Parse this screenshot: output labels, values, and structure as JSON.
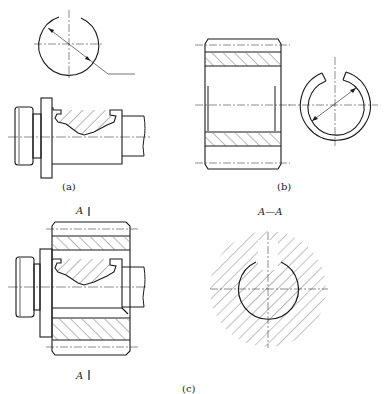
{
  "figure": {
    "captions": {
      "a": "(a)",
      "b": "(b)",
      "c": "(c)"
    },
    "section_markers": {
      "top": "A",
      "bottom": "A",
      "section_title": "A—A"
    },
    "colors": {
      "line": "#1a1a1a",
      "hatch": "#333333",
      "background": "#ffffff"
    }
  }
}
